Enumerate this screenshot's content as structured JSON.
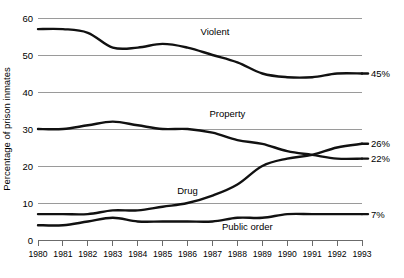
{
  "chart_data": {
    "type": "line",
    "title": "",
    "xlabel": "",
    "ylabel": "Percentage of prison inmates",
    "xlim": [
      1980,
      1993
    ],
    "ylim": [
      0,
      60
    ],
    "grid": true,
    "legend": "inline-labels",
    "yticks": [
      "0",
      "10",
      "20",
      "30",
      "40",
      "50",
      "60"
    ],
    "ytick_values": [
      0,
      10,
      20,
      30,
      40,
      50,
      60
    ],
    "x": [
      1980,
      1981,
      1982,
      1983,
      1984,
      1985,
      1986,
      1987,
      1988,
      1989,
      1990,
      1991,
      1992,
      1993
    ],
    "categories": [
      "1980",
      "1981",
      "1982",
      "1983",
      "1984",
      "1985",
      "1986",
      "1987",
      "1988",
      "1989",
      "1990",
      "1991",
      "1992",
      "1993"
    ],
    "series": [
      {
        "name": "Violent",
        "label": "Violent",
        "end_label": "45%",
        "values": [
          57,
          57,
          56,
          52,
          52,
          53,
          52,
          50,
          48,
          45,
          44,
          44,
          45,
          45
        ]
      },
      {
        "name": "Property",
        "label": "Property",
        "end_label": "22%",
        "values": [
          30,
          30,
          31,
          32,
          31,
          30,
          30,
          29,
          27,
          26,
          24,
          23,
          22,
          22
        ]
      },
      {
        "name": "Drug",
        "label": "Drug",
        "end_label": "26%",
        "values": [
          7,
          7,
          7,
          8,
          8,
          9,
          10,
          12,
          15,
          20,
          22,
          23,
          25,
          26
        ]
      },
      {
        "name": "Public order",
        "label": "Public order",
        "end_label": "7%",
        "values": [
          4,
          4,
          5,
          6,
          5,
          5,
          5,
          5,
          6,
          6,
          7,
          7,
          7,
          7
        ]
      }
    ],
    "series_label_positions": [
      {
        "name": "Violent",
        "x": 1987.1,
        "y": 55.5
      },
      {
        "name": "Property",
        "x": 1987.6,
        "y": 33.2
      },
      {
        "name": "Drug",
        "x": 1986.0,
        "y": 12.5
      },
      {
        "name": "Public order",
        "x": 1988.4,
        "y": 2.6
      }
    ]
  }
}
